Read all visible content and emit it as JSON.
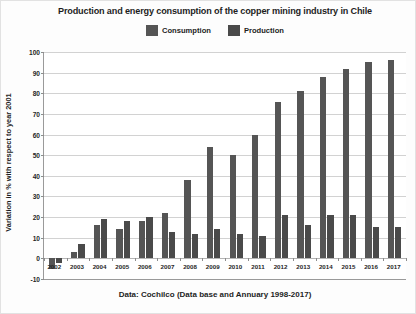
{
  "chart_data": {
    "type": "bar",
    "title": "Production and energy consumption of the copper mining industry in Chile",
    "caption": "Data: Cochilco (Data base and Annuary 1998-2017)",
    "xlabel": "",
    "ylabel": "Variation in % with respect to year 2001",
    "ylim": [
      -10,
      100
    ],
    "ytick_labels": [
      "100",
      "90",
      "80",
      "70",
      "60",
      "50",
      "40",
      "30",
      "20",
      "10",
      "0",
      "-10"
    ],
    "ytick_values": [
      100,
      90,
      80,
      70,
      60,
      50,
      40,
      30,
      20,
      10,
      0,
      -10
    ],
    "grid": true,
    "legend_position": "top-center",
    "categories": [
      "2002",
      "2003",
      "2004",
      "2005",
      "2006",
      "2007",
      "2008",
      "2009",
      "2010",
      "2011",
      "2012",
      "2013",
      "2014",
      "2015",
      "2016",
      "2017"
    ],
    "series": [
      {
        "name": "Consumption",
        "color": "#555555",
        "values": [
          -5,
          3,
          16,
          14,
          18,
          22,
          38,
          54,
          50,
          60,
          76,
          81,
          88,
          92,
          95,
          96
        ]
      },
      {
        "name": "Production",
        "color": "#4a4a4a",
        "values": [
          -2,
          7,
          19,
          18,
          20,
          13,
          12,
          14,
          12,
          11,
          21,
          16,
          21,
          21,
          15,
          15
        ]
      }
    ]
  },
  "legend": {
    "entries": [
      {
        "label": "Consumption",
        "swatch": "legend-swatch-consumption"
      },
      {
        "label": "Production",
        "swatch": "legend-swatch-production"
      }
    ]
  }
}
